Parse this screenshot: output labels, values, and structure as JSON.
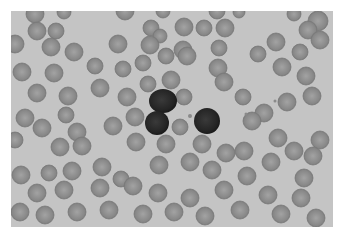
{
  "image": {
    "description": "Grayscale light micrograph of a peripheral blood smear showing red blood cells and three dark-staining lymphocytes",
    "background_color": "#c4c4c4",
    "rbc_fill": "#8e8e8e",
    "rbc_rim": "#7a7a7a",
    "rbc_pallor": "#a6a6a6",
    "wbc_fill": "#262626",
    "red_blood_cells": [
      [
        35,
        14,
        9
      ],
      [
        64,
        12,
        7
      ],
      [
        125,
        11,
        9
      ],
      [
        163,
        11,
        7
      ],
      [
        217,
        11,
        8
      ],
      [
        239,
        12,
        6
      ],
      [
        294,
        14,
        7
      ],
      [
        318,
        21,
        10
      ],
      [
        37,
        31,
        9
      ],
      [
        56,
        31,
        8
      ],
      [
        151,
        28,
        8
      ],
      [
        160,
        36,
        7
      ],
      [
        184,
        27,
        9
      ],
      [
        204,
        28,
        8
      ],
      [
        225,
        28,
        9
      ],
      [
        308,
        30,
        9
      ],
      [
        15,
        44,
        9
      ],
      [
        51,
        47,
        9
      ],
      [
        74,
        52,
        9
      ],
      [
        118,
        44,
        9
      ],
      [
        150,
        45,
        9
      ],
      [
        183,
        50,
        9
      ],
      [
        219,
        48,
        8
      ],
      [
        276,
        42,
        9
      ],
      [
        300,
        52,
        8
      ],
      [
        320,
        40,
        9
      ],
      [
        22,
        72,
        9
      ],
      [
        54,
        73,
        9
      ],
      [
        95,
        66,
        8
      ],
      [
        123,
        69,
        8
      ],
      [
        143,
        63,
        8
      ],
      [
        166,
        56,
        8
      ],
      [
        187,
        56,
        9
      ],
      [
        218,
        68,
        9
      ],
      [
        258,
        54,
        8
      ],
      [
        282,
        67,
        9
      ],
      [
        306,
        76,
        9
      ],
      [
        37,
        93,
        9
      ],
      [
        68,
        96,
        9
      ],
      [
        100,
        88,
        9
      ],
      [
        127,
        97,
        9
      ],
      [
        148,
        84,
        8
      ],
      [
        171,
        80,
        9
      ],
      [
        184,
        97,
        8
      ],
      [
        224,
        82,
        9
      ],
      [
        243,
        97,
        8
      ],
      [
        264,
        113,
        9
      ],
      [
        287,
        102,
        9
      ],
      [
        312,
        96,
        9
      ],
      [
        25,
        118,
        9
      ],
      [
        42,
        128,
        9
      ],
      [
        66,
        115,
        8
      ],
      [
        77,
        132,
        9
      ],
      [
        113,
        126,
        9
      ],
      [
        135,
        117,
        9
      ],
      [
        180,
        127,
        8
      ],
      [
        252,
        121,
        9
      ],
      [
        278,
        138,
        9
      ],
      [
        320,
        140,
        9
      ],
      [
        15,
        140,
        8
      ],
      [
        60,
        147,
        9
      ],
      [
        82,
        146,
        9
      ],
      [
        136,
        142,
        9
      ],
      [
        166,
        144,
        9
      ],
      [
        202,
        144,
        9
      ],
      [
        226,
        153,
        9
      ],
      [
        244,
        151,
        9
      ],
      [
        294,
        151,
        9
      ],
      [
        313,
        156,
        9
      ],
      [
        21,
        175,
        9
      ],
      [
        49,
        173,
        8
      ],
      [
        72,
        171,
        9
      ],
      [
        102,
        167,
        9
      ],
      [
        121,
        179,
        8
      ],
      [
        159,
        165,
        9
      ],
      [
        190,
        162,
        9
      ],
      [
        212,
        170,
        9
      ],
      [
        247,
        176,
        9
      ],
      [
        271,
        162,
        9
      ],
      [
        304,
        178,
        9
      ],
      [
        37,
        193,
        9
      ],
      [
        64,
        190,
        9
      ],
      [
        100,
        188,
        9
      ],
      [
        133,
        186,
        9
      ],
      [
        158,
        193,
        9
      ],
      [
        190,
        198,
        9
      ],
      [
        224,
        190,
        9
      ],
      [
        268,
        195,
        9
      ],
      [
        301,
        198,
        9
      ],
      [
        20,
        212,
        9
      ],
      [
        45,
        215,
        9
      ],
      [
        77,
        212,
        9
      ],
      [
        109,
        210,
        9
      ],
      [
        143,
        214,
        9
      ],
      [
        174,
        212,
        9
      ],
      [
        205,
        216,
        9
      ],
      [
        240,
        210,
        9
      ],
      [
        281,
        214,
        9
      ],
      [
        316,
        218,
        9
      ]
    ],
    "white_blood_cells": [
      {
        "cx": 163,
        "cy": 101,
        "rx": 14,
        "ry": 12,
        "type": "lymphocyte"
      },
      {
        "cx": 157,
        "cy": 123,
        "rx": 12,
        "ry": 12,
        "type": "lymphocyte"
      },
      {
        "cx": 207,
        "cy": 121,
        "rx": 13,
        "ry": 13,
        "type": "lymphocyte"
      }
    ],
    "platelets": [
      [
        190,
        116,
        2
      ],
      [
        246,
        114,
        1.5
      ],
      [
        275,
        101,
        1.5
      ]
    ]
  }
}
